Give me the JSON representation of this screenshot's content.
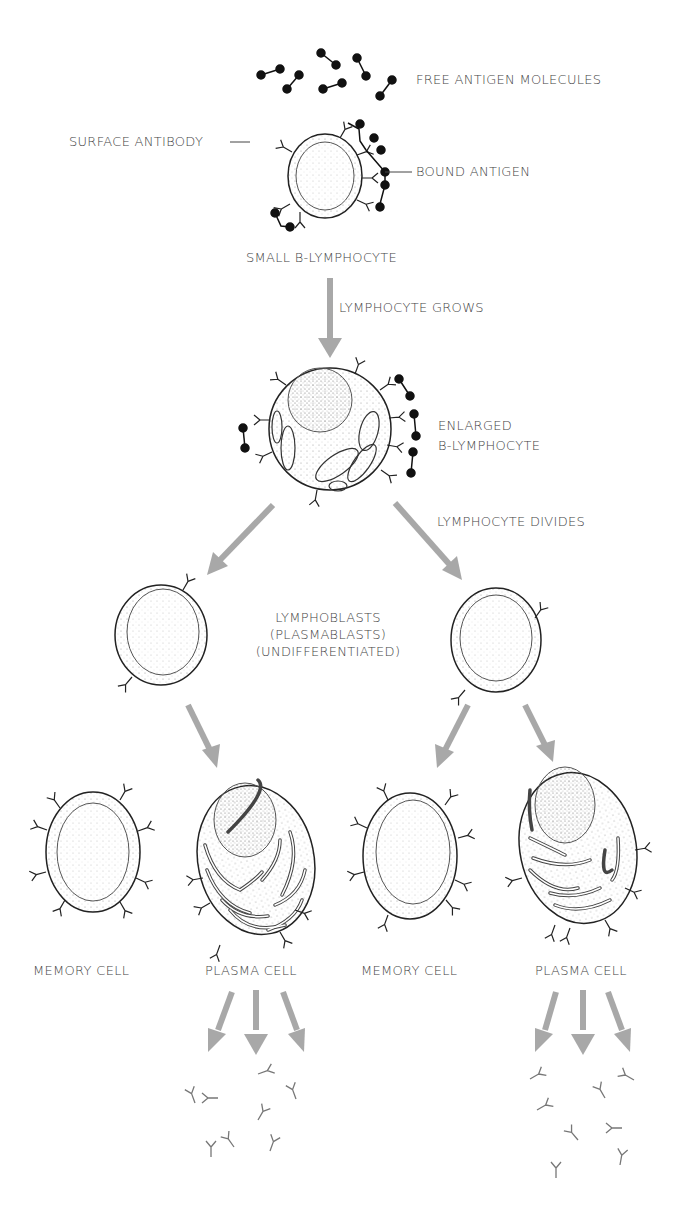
{
  "diagram": {
    "type": "B-lymphocyte differentiation flow",
    "colors": {
      "arrow": "#a8a8a8",
      "ink": "#222222",
      "antigen": "#111111",
      "label": "#444444",
      "background": "#ffffff"
    },
    "labels": {
      "free_antigen": "FREE ANTIGEN MOLECULES",
      "surface_antibody": "SURFACE ANTIBODY",
      "bound_antigen": "BOUND ANTIGEN",
      "small_b": "SMALL B-LYMPHOCYTE",
      "grows": "LYMPHOCYTE GROWS",
      "enlarged_1": "ENLARGED",
      "enlarged_2": "B-LYMPHOCYTE",
      "divides": "LYMPHOCYTE DIVIDES",
      "lymphoblasts_1": "LYMPHOBLASTS",
      "lymphoblasts_2": "(PLASMABLASTS)",
      "lymphoblasts_3": "(UNDIFFERENTIATED)",
      "memory_1": "MEMORY CELL",
      "plasma_1": "PLASMA CELL",
      "memory_2": "MEMORY CELL",
      "plasma_2": "PLASMA CELL"
    },
    "nodes": [
      {
        "id": "small-b-lymphocyte",
        "label": "SMALL B-LYMPHOCYTE"
      },
      {
        "id": "enlarged-b-lymphocyte",
        "label": "ENLARGED B-LYMPHOCYTE"
      },
      {
        "id": "lymphoblast-left",
        "label": "LYMPHOBLASTS (PLASMABLASTS) (UNDIFFERENTIATED)"
      },
      {
        "id": "lymphoblast-right",
        "label": "LYMPHOBLASTS (PLASMABLASTS) (UNDIFFERENTIATED)"
      },
      {
        "id": "memory-cell-1",
        "label": "MEMORY CELL"
      },
      {
        "id": "plasma-cell-1",
        "label": "PLASMA CELL"
      },
      {
        "id": "memory-cell-2",
        "label": "MEMORY CELL"
      },
      {
        "id": "plasma-cell-2",
        "label": "PLASMA CELL"
      }
    ],
    "edges": [
      {
        "from": "small-b-lymphocyte",
        "to": "enlarged-b-lymphocyte",
        "label": "LYMPHOCYTE GROWS"
      },
      {
        "from": "enlarged-b-lymphocyte",
        "to": "lymphoblast-left",
        "label": "LYMPHOCYTE DIVIDES"
      },
      {
        "from": "enlarged-b-lymphocyte",
        "to": "lymphoblast-right",
        "label": "LYMPHOCYTE DIVIDES"
      },
      {
        "from": "lymphoblast-left",
        "to": "plasma-cell-1"
      },
      {
        "from": "lymphoblast-right",
        "to": "memory-cell-2"
      },
      {
        "from": "lymphoblast-right",
        "to": "plasma-cell-2"
      },
      {
        "from": "plasma-cell-1",
        "to": "free-antibodies-1"
      },
      {
        "from": "plasma-cell-2",
        "to": "free-antibodies-2"
      }
    ]
  }
}
